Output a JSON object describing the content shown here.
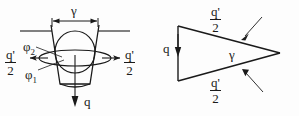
{
  "figure": {
    "type": "technical-diagram",
    "title": "",
    "background_color": "#fdfdfd",
    "line_color": "#1a1a1a",
    "width": 299,
    "height": 116
  },
  "left_diagram": {
    "name": "wedge-cross-section-view",
    "description": "Trapezoidal wedge with inscribed circle and flattened ellipse, horizontal reference lines, force arrows",
    "labels": {
      "gamma_top": "γ",
      "phi_upper": "φ",
      "phi_upper_sub": "2",
      "phi_lower": "φ",
      "phi_lower_sub": "1",
      "force_left_num": "q'",
      "force_left_den": "2",
      "force_right_num": "q'",
      "force_right_den": "2",
      "force_down": "q"
    }
  },
  "right_diagram": {
    "name": "wedge-triangle-view",
    "description": "Triangular wedge pointing right with apex angle gamma and force components",
    "labels": {
      "force_vertical": "q",
      "force_top_num": "q'",
      "force_top_den": "2",
      "force_bottom_num": "q'",
      "force_bottom_den": "2",
      "apex_angle": "γ"
    }
  }
}
